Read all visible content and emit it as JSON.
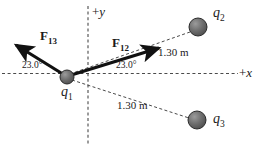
{
  "figure": {
    "type": "physics-free-body-diagram",
    "width": 273,
    "height": 149,
    "background_color": "#ffffff",
    "ink_color": "#1a1a1a",
    "sphere_fill": "#6e6e6e",
    "sphere_stroke": "#2b2b2b"
  },
  "axes": {
    "x_label": "+x",
    "y_label": "+y",
    "style": "dashed",
    "origin_x": 67,
    "origin_y": 77
  },
  "charges": [
    {
      "id": "q1",
      "label": "q",
      "subscript": "1",
      "x": 67,
      "y": 77,
      "radius": 7
    },
    {
      "id": "q2",
      "label": "q",
      "subscript": "2",
      "x": 198,
      "y": 27,
      "radius": 9
    },
    {
      "id": "q3",
      "label": "q",
      "subscript": "3",
      "x": 197,
      "y": 120,
      "radius": 9
    }
  ],
  "forces": [
    {
      "id": "F13",
      "label": "F",
      "subscript": "13",
      "angle_label": "23.0°",
      "direction": "up-left",
      "tip_x": 11,
      "tip_y": 42
    },
    {
      "id": "F12",
      "label": "F",
      "subscript": "12",
      "angle_label": "23.0°",
      "direction": "up-right",
      "tip_x": 166,
      "tip_y": 45
    }
  ],
  "distances": [
    {
      "id": "r12",
      "text": "1.30 m",
      "from": "q1",
      "to": "q2"
    },
    {
      "id": "r13",
      "text": "1.30 m",
      "from": "q1",
      "to": "q3"
    }
  ]
}
